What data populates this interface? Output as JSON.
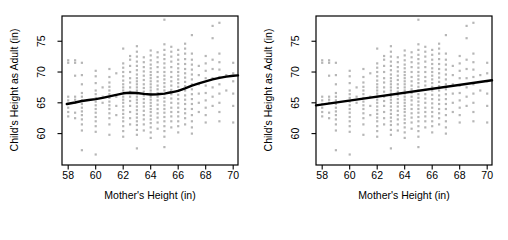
{
  "chart_data": {
    "type": "scatter",
    "title": "",
    "xlabel": "Mother's Height (in)",
    "ylabel": "Child's Height as Adult (in)",
    "x_ticks": [
      58,
      60,
      62,
      64,
      66,
      68,
      70
    ],
    "y_ticks": [
      60,
      65,
      70,
      75
    ],
    "xlim": [
      57.55,
      70.35
    ],
    "ylim": [
      54.9,
      79.1
    ],
    "grid": false,
    "legend": "none",
    "point_color": "#b6b6b6",
    "line_color": "#000000",
    "axis_color": "#000000",
    "points": [
      [
        58,
        62.8
      ],
      [
        58,
        63.5
      ],
      [
        58,
        64.2
      ],
      [
        58,
        64.8
      ],
      [
        58,
        65.4
      ],
      [
        58,
        66
      ],
      [
        58,
        71.5
      ],
      [
        58,
        71.9
      ],
      [
        58.5,
        62.5
      ],
      [
        58.5,
        63.4
      ],
      [
        58.5,
        65
      ],
      [
        58.5,
        65.5
      ],
      [
        58.5,
        66
      ],
      [
        58.5,
        69.4
      ],
      [
        58.5,
        71.5
      ],
      [
        58.5,
        71.9
      ],
      [
        59,
        57.3
      ],
      [
        59,
        60.5
      ],
      [
        59,
        61.5
      ],
      [
        59,
        62.3
      ],
      [
        59,
        63
      ],
      [
        59,
        63.6
      ],
      [
        59,
        64.2
      ],
      [
        59,
        64.8
      ],
      [
        59,
        65.4
      ],
      [
        59,
        66
      ],
      [
        59,
        66.6
      ],
      [
        59,
        68
      ],
      [
        59,
        69.5
      ],
      [
        59,
        71.5
      ],
      [
        60,
        56.6
      ],
      [
        60,
        60.3
      ],
      [
        60,
        61.2
      ],
      [
        60,
        62
      ],
      [
        60,
        62.7
      ],
      [
        60,
        63.4
      ],
      [
        60,
        64
      ],
      [
        60,
        64.6
      ],
      [
        60,
        65.2
      ],
      [
        60,
        65.8
      ],
      [
        60,
        66.4
      ],
      [
        60,
        67
      ],
      [
        60,
        68.2
      ],
      [
        60,
        69.3
      ],
      [
        60,
        70.2
      ],
      [
        60.5,
        65
      ],
      [
        60.5,
        66
      ],
      [
        60.5,
        67.5
      ],
      [
        61,
        59.8
      ],
      [
        61,
        61.5
      ],
      [
        61,
        62.5
      ],
      [
        61,
        63.3
      ],
      [
        61,
        64
      ],
      [
        61,
        64.6
      ],
      [
        61,
        65.2
      ],
      [
        61,
        65.8
      ],
      [
        61,
        66.4
      ],
      [
        61,
        67
      ],
      [
        61,
        67.6
      ],
      [
        61,
        68.3
      ],
      [
        61,
        69.2
      ],
      [
        61,
        70.5
      ],
      [
        61.5,
        63
      ],
      [
        61.5,
        64.5
      ],
      [
        61.5,
        66
      ],
      [
        61.5,
        69.8
      ],
      [
        62,
        59.5
      ],
      [
        62,
        60.4
      ],
      [
        62,
        61.2
      ],
      [
        62,
        62
      ],
      [
        62,
        62.6
      ],
      [
        62,
        63.2
      ],
      [
        62,
        63.8
      ],
      [
        62,
        64.4
      ],
      [
        62,
        65
      ],
      [
        62,
        65.5
      ],
      [
        62,
        66
      ],
      [
        62,
        66.5
      ],
      [
        62,
        67
      ],
      [
        62,
        67.5
      ],
      [
        62,
        68
      ],
      [
        62,
        68.6
      ],
      [
        62,
        69.3
      ],
      [
        62,
        70
      ],
      [
        62,
        70.7
      ],
      [
        62,
        71.4
      ],
      [
        62,
        73.8
      ],
      [
        62.5,
        61.5
      ],
      [
        62.5,
        62.5
      ],
      [
        62.5,
        63.5
      ],
      [
        62.5,
        64.5
      ],
      [
        62.5,
        65.3
      ],
      [
        62.5,
        66
      ],
      [
        62.5,
        66.8
      ],
      [
        62.5,
        67.5
      ],
      [
        62.5,
        68.3
      ],
      [
        62.5,
        69
      ],
      [
        62.5,
        70
      ],
      [
        62.5,
        71
      ],
      [
        62.5,
        72
      ],
      [
        62.5,
        72.6
      ],
      [
        63,
        57.6
      ],
      [
        63,
        59.8
      ],
      [
        63,
        60.6
      ],
      [
        63,
        61.4
      ],
      [
        63,
        62
      ],
      [
        63,
        62.6
      ],
      [
        63,
        63.2
      ],
      [
        63,
        63.8
      ],
      [
        63,
        64.4
      ],
      [
        63,
        65
      ],
      [
        63,
        65.5
      ],
      [
        63,
        66
      ],
      [
        63,
        66.5
      ],
      [
        63,
        67
      ],
      [
        63,
        67.5
      ],
      [
        63,
        68
      ],
      [
        63,
        68.5
      ],
      [
        63,
        69
      ],
      [
        63,
        69.6
      ],
      [
        63,
        70.3
      ],
      [
        63,
        71
      ],
      [
        63,
        71.7
      ],
      [
        63,
        72.5
      ],
      [
        63,
        73.3
      ],
      [
        63,
        74.2
      ],
      [
        63.5,
        60.5
      ],
      [
        63.5,
        61.5
      ],
      [
        63.5,
        62.3
      ],
      [
        63.5,
        63
      ],
      [
        63.5,
        63.7
      ],
      [
        63.5,
        64.4
      ],
      [
        63.5,
        65
      ],
      [
        63.5,
        65.6
      ],
      [
        63.5,
        66.2
      ],
      [
        63.5,
        66.8
      ],
      [
        63.5,
        67.4
      ],
      [
        63.5,
        68
      ],
      [
        63.5,
        68.7
      ],
      [
        63.5,
        69.4
      ],
      [
        63.5,
        70.1
      ],
      [
        63.5,
        70.8
      ],
      [
        63.5,
        71.6
      ],
      [
        63.5,
        72.4
      ],
      [
        64,
        59.3
      ],
      [
        64,
        60.2
      ],
      [
        64,
        61
      ],
      [
        64,
        61.7
      ],
      [
        64,
        62.3
      ],
      [
        64,
        62.9
      ],
      [
        64,
        63.5
      ],
      [
        64,
        64
      ],
      [
        64,
        64.5
      ],
      [
        64,
        65
      ],
      [
        64,
        65.5
      ],
      [
        64,
        66
      ],
      [
        64,
        66.5
      ],
      [
        64,
        67
      ],
      [
        64,
        67.5
      ],
      [
        64,
        68
      ],
      [
        64,
        68.5
      ],
      [
        64,
        69
      ],
      [
        64,
        69.5
      ],
      [
        64,
        70
      ],
      [
        64,
        70.6
      ],
      [
        64,
        71.2
      ],
      [
        64,
        71.9
      ],
      [
        64,
        72.7
      ],
      [
        64,
        73.5
      ],
      [
        64.5,
        60.8
      ],
      [
        64.5,
        61.8
      ],
      [
        64.5,
        62.6
      ],
      [
        64.5,
        63.3
      ],
      [
        64.5,
        64
      ],
      [
        64.5,
        64.7
      ],
      [
        64.5,
        65.4
      ],
      [
        64.5,
        66
      ],
      [
        64.5,
        66.6
      ],
      [
        64.5,
        67.2
      ],
      [
        64.5,
        67.8
      ],
      [
        64.5,
        68.5
      ],
      [
        64.5,
        69.2
      ],
      [
        64.5,
        70
      ],
      [
        64.5,
        70.8
      ],
      [
        64.5,
        71.6
      ],
      [
        64.5,
        72.4
      ],
      [
        64.5,
        73.2
      ],
      [
        65,
        57.8
      ],
      [
        65,
        59.5
      ],
      [
        65,
        60.4
      ],
      [
        65,
        61.2
      ],
      [
        65,
        62
      ],
      [
        65,
        62.7
      ],
      [
        65,
        63.4
      ],
      [
        65,
        64
      ],
      [
        65,
        64.6
      ],
      [
        65,
        65.2
      ],
      [
        65,
        65.8
      ],
      [
        65,
        66.4
      ],
      [
        65,
        67
      ],
      [
        65,
        67.6
      ],
      [
        65,
        68.2
      ],
      [
        65,
        68.8
      ],
      [
        65,
        69.4
      ],
      [
        65,
        70
      ],
      [
        65,
        70.7
      ],
      [
        65,
        71.4
      ],
      [
        65,
        72.1
      ],
      [
        65,
        72.8
      ],
      [
        65,
        73.6
      ],
      [
        65,
        74.5
      ],
      [
        65,
        78.5
      ],
      [
        65.5,
        61
      ],
      [
        65.5,
        62
      ],
      [
        65.5,
        62.8
      ],
      [
        65.5,
        63.5
      ],
      [
        65.5,
        64.2
      ],
      [
        65.5,
        65
      ],
      [
        65.5,
        65.7
      ],
      [
        65.5,
        66.4
      ],
      [
        65.5,
        67.1
      ],
      [
        65.5,
        67.8
      ],
      [
        65.5,
        68.5
      ],
      [
        65.5,
        69.2
      ],
      [
        65.5,
        70
      ],
      [
        65.5,
        70.8
      ],
      [
        65.5,
        71.7
      ],
      [
        65.5,
        72.5
      ],
      [
        65.5,
        73.3
      ],
      [
        65.5,
        74.1
      ],
      [
        66,
        60.2
      ],
      [
        66,
        61.2
      ],
      [
        66,
        62
      ],
      [
        66,
        62.8
      ],
      [
        66,
        63.5
      ],
      [
        66,
        64.2
      ],
      [
        66,
        64.9
      ],
      [
        66,
        65.6
      ],
      [
        66,
        66.3
      ],
      [
        66,
        67
      ],
      [
        66,
        67.6
      ],
      [
        66,
        68.2
      ],
      [
        66,
        68.8
      ],
      [
        66,
        69.4
      ],
      [
        66,
        70
      ],
      [
        66,
        70.6
      ],
      [
        66,
        71.3
      ],
      [
        66,
        72
      ],
      [
        66,
        72.8
      ],
      [
        66,
        73.6
      ],
      [
        66.5,
        61.5
      ],
      [
        66.5,
        62.5
      ],
      [
        66.5,
        63.3
      ],
      [
        66.5,
        64
      ],
      [
        66.5,
        64.8
      ],
      [
        66.5,
        65.5
      ],
      [
        66.5,
        66.2
      ],
      [
        66.5,
        67
      ],
      [
        66.5,
        67.7
      ],
      [
        66.5,
        68.4
      ],
      [
        66.5,
        69.1
      ],
      [
        66.5,
        69.8
      ],
      [
        66.5,
        70.5
      ],
      [
        66.5,
        71.3
      ],
      [
        66.5,
        72.1
      ],
      [
        66.5,
        73
      ],
      [
        66.5,
        73.8
      ],
      [
        66.5,
        74.6
      ],
      [
        67,
        60
      ],
      [
        67,
        61
      ],
      [
        67,
        62
      ],
      [
        67,
        63
      ],
      [
        67,
        64
      ],
      [
        67,
        64.8
      ],
      [
        67,
        65.6
      ],
      [
        67,
        66.4
      ],
      [
        67,
        67.2
      ],
      [
        67,
        68
      ],
      [
        67,
        68.8
      ],
      [
        67,
        69.6
      ],
      [
        67,
        70.4
      ],
      [
        67,
        71.2
      ],
      [
        67,
        72
      ],
      [
        67,
        73
      ],
      [
        67,
        76
      ],
      [
        67.5,
        63.5
      ],
      [
        67.5,
        65
      ],
      [
        67.5,
        66.5
      ],
      [
        67.5,
        68
      ],
      [
        67.5,
        69.5
      ],
      [
        67.5,
        71
      ],
      [
        68,
        61.8
      ],
      [
        68,
        63
      ],
      [
        68,
        64.2
      ],
      [
        68,
        65.4
      ],
      [
        68,
        66.6
      ],
      [
        68,
        67.8
      ],
      [
        68,
        69
      ],
      [
        68,
        70.2
      ],
      [
        68,
        71.4
      ],
      [
        68,
        72.6
      ],
      [
        68.5,
        64.5
      ],
      [
        68.5,
        66
      ],
      [
        68.5,
        67.5
      ],
      [
        68.5,
        69
      ],
      [
        68.5,
        70.5
      ],
      [
        68.5,
        72
      ],
      [
        68.5,
        75.5
      ],
      [
        68.5,
        77.5
      ],
      [
        69,
        62
      ],
      [
        69,
        63.5
      ],
      [
        69,
        65
      ],
      [
        69,
        66.5
      ],
      [
        69,
        68
      ],
      [
        69,
        69.2
      ],
      [
        69,
        70.4
      ],
      [
        69,
        71.6
      ],
      [
        69,
        73
      ],
      [
        69,
        78
      ],
      [
        69.5,
        67
      ],
      [
        69.5,
        69.5
      ],
      [
        70,
        61.8
      ],
      [
        70,
        64.5
      ],
      [
        70,
        66.5
      ],
      [
        70,
        68.5
      ],
      [
        70,
        69.8
      ],
      [
        70,
        71.5
      ]
    ],
    "panels": [
      {
        "id": "loess-smooth",
        "fit_type": "smooth-curve",
        "curve": [
          [
            57.9,
            64.8
          ],
          [
            58.5,
            65.05
          ],
          [
            59,
            65.3
          ],
          [
            59.5,
            65.45
          ],
          [
            60,
            65.6
          ],
          [
            60.5,
            65.8
          ],
          [
            61,
            66.05
          ],
          [
            61.5,
            66.3
          ],
          [
            62,
            66.55
          ],
          [
            62.5,
            66.65
          ],
          [
            63,
            66.6
          ],
          [
            63.5,
            66.45
          ],
          [
            64,
            66.35
          ],
          [
            64.5,
            66.4
          ],
          [
            65,
            66.5
          ],
          [
            65.5,
            66.7
          ],
          [
            66,
            66.95
          ],
          [
            66.5,
            67.35
          ],
          [
            67,
            67.8
          ],
          [
            67.5,
            68.15
          ],
          [
            68,
            68.5
          ],
          [
            68.5,
            68.8
          ],
          [
            69,
            69.05
          ],
          [
            69.5,
            69.25
          ],
          [
            70,
            69.4
          ],
          [
            70.35,
            69.45
          ]
        ]
      },
      {
        "id": "linear-fit",
        "fit_type": "straight-line",
        "curve": [
          [
            57.55,
            64.58
          ],
          [
            70.35,
            68.66
          ]
        ]
      }
    ]
  }
}
